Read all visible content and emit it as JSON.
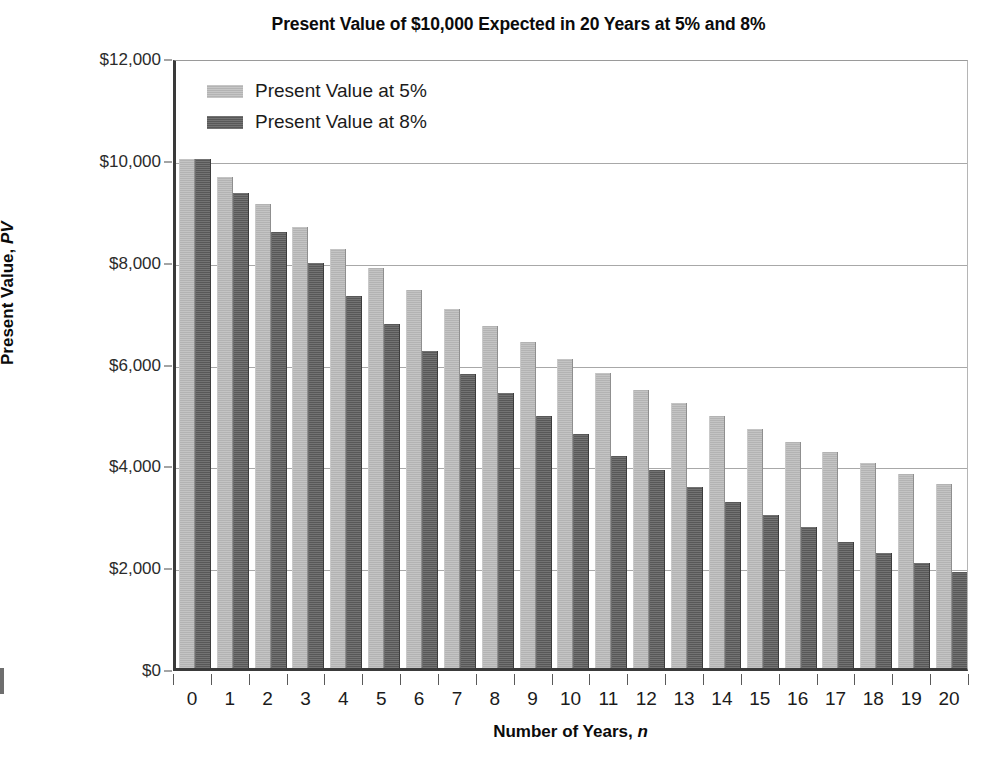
{
  "chart_data": {
    "type": "bar",
    "title": "Present Value of $10,000 Expected in 20 Years at 5% and 8%",
    "xlabel_text": "Number of  Years, ",
    "xlabel_italic": "n",
    "ylabel_text": "Present Value, ",
    "ylabel_italic": "PV",
    "categories": [
      0,
      1,
      2,
      3,
      4,
      5,
      6,
      7,
      8,
      9,
      10,
      11,
      12,
      13,
      14,
      15,
      16,
      17,
      18,
      19,
      20
    ],
    "series": [
      {
        "name": "Present Value at 5%",
        "color": "#b3b3b3",
        "values": [
          10000,
          9638,
          9113,
          8654,
          8223,
          7864,
          7432,
          7060,
          6723,
          6394,
          6077,
          5791,
          5462,
          5202,
          4940,
          4700,
          4430,
          4240,
          4035,
          3810,
          3610
        ]
      },
      {
        "name": "Present Value at 8%",
        "color": "#585858",
        "values": [
          10000,
          9320,
          8570,
          7960,
          7300,
          6760,
          6230,
          5780,
          5400,
          4950,
          4600,
          4160,
          3880,
          3560,
          3260,
          3000,
          2760,
          2470,
          2250,
          2060,
          1880
        ]
      }
    ],
    "ylim": [
      0,
      12000
    ],
    "ytick_values": [
      0,
      2000,
      4000,
      6000,
      8000,
      10000,
      12000
    ],
    "ytick_labels": [
      "$0",
      "$2,000",
      "$4,000",
      "$6,000",
      "$8,000",
      "$10,000",
      "$12,000"
    ],
    "xtick_labels": [
      "0",
      "1",
      "2",
      "3",
      "4",
      "5",
      "6",
      "7",
      "8",
      "9",
      "10",
      "11",
      "12",
      "13",
      "14",
      "15",
      "16",
      "17",
      "18",
      "19",
      "20"
    ],
    "grid": true,
    "grid_axis": "y",
    "legend_position": "top-left-inside",
    "plot_background": "#ffffff",
    "axis_color": "#3a3a3a",
    "gridline_color": "#a8a8a8"
  },
  "legend": {
    "entries": [
      {
        "label": "Present Value at 5%",
        "swatch": "light-gray-swatch"
      },
      {
        "label": "Present Value at 8%",
        "swatch": "dark-gray-swatch"
      }
    ]
  }
}
